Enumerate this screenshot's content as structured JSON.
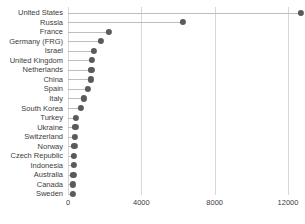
{
  "chart_data": {
    "type": "bar",
    "subtype": "lollipop-dot-plot",
    "title": "",
    "subtitle": "",
    "xlabel": "",
    "ylabel": "",
    "orientation": "horizontal",
    "grid": "vertical-only",
    "legend": "none",
    "xlim": [
      0,
      13000
    ],
    "xticks": [
      0,
      4000,
      8000,
      12000
    ],
    "xtick_labels": [
      "0",
      "4000",
      "8000",
      "12000"
    ],
    "categories": [
      "United States",
      "Russia",
      "France",
      "Germany (FRG)",
      "Israel",
      "United Kingdom",
      "Netherlands",
      "China",
      "Spain",
      "Italy",
      "South Korea",
      "Turkey",
      "Ukraine",
      "Switzerland",
      "Norway",
      "Czech Republic",
      "Indonesia",
      "Australia",
      "Canada",
      "Sweden"
    ],
    "values": [
      12700,
      6270,
      2240,
      1800,
      1420,
      1310,
      1280,
      1260,
      1090,
      880,
      710,
      440,
      400,
      370,
      350,
      330,
      310,
      290,
      270,
      250
    ],
    "marker": {
      "shape": "circle",
      "color": "#5a5a5a",
      "size": 6
    },
    "stem_color": "#bdbdbd",
    "gridline_color": "#d8d8d8",
    "axis_text_color": "#3c3c3c"
  }
}
